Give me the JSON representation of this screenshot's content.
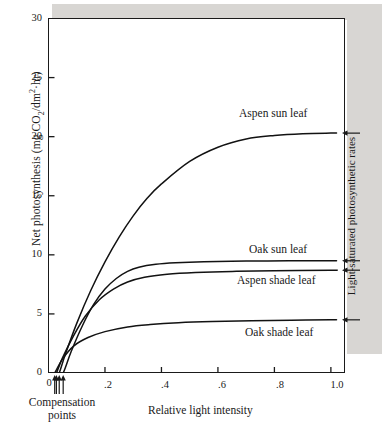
{
  "figure": {
    "name": "light-response-curves-of-photosynthesis",
    "caption_fragment": ""
  },
  "chart_data": {
    "type": "line",
    "title": "",
    "xlabel": "Relative light intensity",
    "ylabel": "Net photosynthesis (mg CO2/dm2·hr)",
    "ylabel_parts": {
      "prefix": "Net photosynthesis (mg CO",
      "sub1": "2",
      "mid": "/dm",
      "sup1": "2",
      "suffix": "·hr)"
    },
    "xlim": [
      0,
      1.05
    ],
    "ylim": [
      0,
      30
    ],
    "grid": false,
    "legend_position": "inline-right-of-curves",
    "x_ticks": [
      {
        "value": 0,
        "label": "0"
      },
      {
        "value": 0.2,
        "label": ".2"
      },
      {
        "value": 0.4,
        "label": ".4"
      },
      {
        "value": 0.6,
        "label": ".6"
      },
      {
        "value": 0.8,
        "label": ".8"
      },
      {
        "value": 1.0,
        "label": "1.0"
      }
    ],
    "y_ticks": [
      {
        "value": 0,
        "label": "0"
      },
      {
        "value": 5,
        "label": "5"
      },
      {
        "value": 10,
        "label": "10"
      },
      {
        "value": 15,
        "label": "15"
      },
      {
        "value": 20,
        "label": "20"
      },
      {
        "value": 25,
        "label": "25"
      },
      {
        "value": 30,
        "label": "30"
      }
    ],
    "series": [
      {
        "name": "Aspen sun leaf",
        "label": "Aspen sun leaf",
        "saturation_value": 20.3,
        "compensation_point": 0.038,
        "x": [
          0.0,
          0.02,
          0.038,
          0.06,
          0.1,
          0.15,
          0.2,
          0.25,
          0.3,
          0.35,
          0.4,
          0.5,
          0.6,
          0.7,
          0.8,
          0.9,
          1.0,
          1.02
        ],
        "y": [
          -2.0,
          -0.9,
          0.0,
          1.6,
          4.2,
          7.0,
          9.4,
          11.5,
          13.3,
          14.8,
          16.0,
          17.9,
          19.1,
          19.8,
          20.1,
          20.25,
          20.3,
          20.3
        ]
      },
      {
        "name": "Oak sun leaf",
        "label": "Oak sun leaf",
        "saturation_value": 9.5,
        "compensation_point": 0.052,
        "x": [
          0.0,
          0.02,
          0.052,
          0.08,
          0.12,
          0.16,
          0.2,
          0.24,
          0.28,
          0.32,
          0.38,
          0.45,
          0.55,
          0.7,
          0.85,
          1.0,
          1.02
        ],
        "y": [
          -2.6,
          -1.4,
          0.0,
          1.8,
          4.0,
          5.8,
          7.1,
          8.0,
          8.6,
          8.95,
          9.2,
          9.33,
          9.42,
          9.47,
          9.49,
          9.5,
          9.5
        ]
      },
      {
        "name": "Aspen shade leaf",
        "label": "Aspen shade leaf",
        "saturation_value": 8.7,
        "compensation_point": 0.028,
        "x": [
          0.0,
          0.015,
          0.028,
          0.05,
          0.09,
          0.13,
          0.18,
          0.23,
          0.28,
          0.34,
          0.42,
          0.52,
          0.65,
          0.8,
          1.0,
          1.02
        ],
        "y": [
          -1.4,
          -0.6,
          0.0,
          1.3,
          3.2,
          4.8,
          6.2,
          7.1,
          7.7,
          8.1,
          8.35,
          8.5,
          8.6,
          8.65,
          8.7,
          8.7
        ]
      },
      {
        "name": "Oak shade leaf",
        "label": "Oak shade leaf",
        "saturation_value": 4.5,
        "compensation_point": 0.022,
        "x": [
          0.0,
          0.012,
          0.022,
          0.05,
          0.09,
          0.14,
          0.2,
          0.28,
          0.36,
          0.46,
          0.58,
          0.72,
          0.86,
          1.0,
          1.02
        ],
        "y": [
          -1.0,
          -0.4,
          0.0,
          1.2,
          2.3,
          3.0,
          3.5,
          3.9,
          4.1,
          4.25,
          4.35,
          4.42,
          4.47,
          4.5,
          4.5
        ]
      }
    ],
    "annotations": [
      {
        "name": "compensation-points",
        "label": "Compensation\npoints",
        "line1": "Compensation",
        "line2": "points"
      },
      {
        "name": "light-saturated-rates",
        "label": "Light-saturated photosynthetic rates"
      }
    ],
    "compensation_arrows": [
      0.022,
      0.028,
      0.038,
      0.052
    ]
  }
}
